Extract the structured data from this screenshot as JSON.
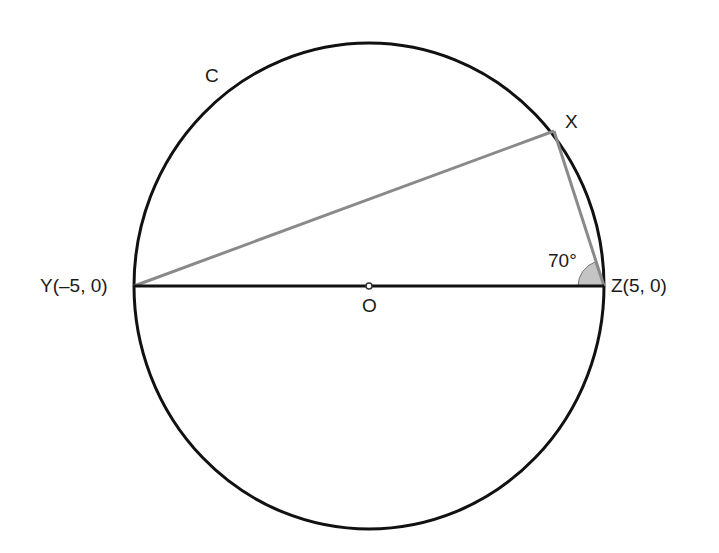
{
  "diagram": {
    "type": "geometry",
    "labels": {
      "circle": "C",
      "point_x": "X",
      "point_y": "Y(–5, 0)",
      "point_z": "Z(5, 0)",
      "center": "O",
      "angle": "70°"
    },
    "points": {
      "Y": [
        -5,
        0
      ],
      "Z": [
        5,
        0
      ],
      "O": [
        0,
        0
      ]
    },
    "angle_at_Z_degrees": 70,
    "colors": {
      "circle": "#111111",
      "diameter": "#111111",
      "chords": "#8a8a8a",
      "angle_fill": "#bdbdbd"
    }
  }
}
